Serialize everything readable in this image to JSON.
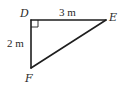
{
  "diagram": {
    "type": "right-triangle",
    "vertices": [
      {
        "id": "D",
        "label": "D",
        "right_angle": true
      },
      {
        "id": "E",
        "label": "E"
      },
      {
        "id": "F",
        "label": "F"
      }
    ],
    "sides": [
      {
        "from": "D",
        "to": "E",
        "length_label": "3 m"
      },
      {
        "from": "D",
        "to": "F",
        "length_label": "2 m"
      },
      {
        "from": "E",
        "to": "F",
        "length_label": ""
      }
    ],
    "colors": {
      "line": "#1e1e1e",
      "text": "#2a2a2a",
      "background": "#ffffff"
    }
  }
}
